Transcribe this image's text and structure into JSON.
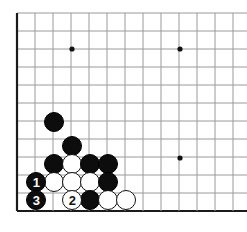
{
  "board": {
    "type": "go-board",
    "title": "Go board diagram - lower left corner",
    "grid": {
      "origin_x": 17,
      "origin_y": 13,
      "spacing": 18,
      "cols": 13,
      "rows": 12,
      "line_color": "#9a9a9a",
      "edge_color": "#1a1a1a",
      "background": "#ffffff"
    },
    "star_points": [
      {
        "x": 72,
        "y": 49
      },
      {
        "x": 180,
        "y": 49
      },
      {
        "x": 180,
        "y": 158
      }
    ],
    "stone_radius": 10,
    "colors": {
      "black": "#0d0d0d",
      "white": "#ffffff",
      "black_label": "#ffffff",
      "white_label": "#111111"
    },
    "stones": [
      {
        "color": "black",
        "x": 54,
        "y": 122,
        "label": ""
      },
      {
        "color": "black",
        "x": 72,
        "y": 146,
        "label": ""
      },
      {
        "color": "black",
        "x": 54,
        "y": 164,
        "label": ""
      },
      {
        "color": "white",
        "x": 72,
        "y": 164,
        "label": ""
      },
      {
        "color": "black",
        "x": 90,
        "y": 164,
        "label": ""
      },
      {
        "color": "black",
        "x": 108,
        "y": 164,
        "label": ""
      },
      {
        "color": "black",
        "x": 36,
        "y": 182,
        "label": "1"
      },
      {
        "color": "white",
        "x": 54,
        "y": 182,
        "label": ""
      },
      {
        "color": "white",
        "x": 72,
        "y": 182,
        "label": ""
      },
      {
        "color": "white",
        "x": 90,
        "y": 182,
        "label": ""
      },
      {
        "color": "black",
        "x": 108,
        "y": 182,
        "label": ""
      },
      {
        "color": "black",
        "x": 36,
        "y": 200,
        "label": "3"
      },
      {
        "color": "white",
        "x": 72,
        "y": 200,
        "label": "2"
      },
      {
        "color": "black",
        "x": 90,
        "y": 200,
        "label": ""
      },
      {
        "color": "white",
        "x": 108,
        "y": 200,
        "label": ""
      },
      {
        "color": "white",
        "x": 126,
        "y": 200,
        "label": ""
      }
    ],
    "move_sequence": [
      {
        "number": "1",
        "color": "black"
      },
      {
        "number": "2",
        "color": "white"
      },
      {
        "number": "3",
        "color": "black"
      }
    ]
  }
}
